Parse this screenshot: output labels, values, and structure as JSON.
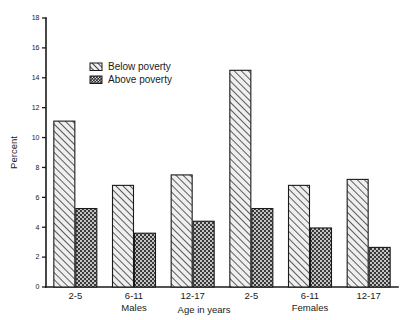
{
  "chart_data": {
    "type": "bar",
    "title": "",
    "subtitle": "",
    "xlabel": "Age in years",
    "ylabel": "Percent",
    "ylim": [
      0,
      18
    ],
    "ytick_step": 2,
    "yticks": [
      "0",
      "2",
      "4",
      "6",
      "8",
      "10",
      "12",
      "14",
      "16",
      "18"
    ],
    "grid": false,
    "legend_position": "upper-left-inside",
    "categories": [
      "2-5",
      "6-11",
      "12-17",
      "2-5",
      "6-11",
      "12-17"
    ],
    "group_labels": [
      "Males",
      "Females"
    ],
    "series": [
      {
        "name": "Below poverty",
        "pattern": "diagonal-hatch",
        "color": "#e8e8e8",
        "values": [
          11.1,
          6.8,
          7.5,
          14.5,
          6.8,
          7.2
        ]
      },
      {
        "name": "Above poverty",
        "pattern": "checkered-dots",
        "color": "#3a3a3a",
        "values": [
          5.25,
          3.6,
          4.4,
          5.25,
          3.95,
          2.65
        ]
      }
    ]
  },
  "legend": {
    "items": [
      {
        "label": "Below poverty"
      },
      {
        "label": "Above poverty"
      }
    ]
  },
  "axes": {
    "y_title": "Percent",
    "x_title": "Age in years"
  },
  "colors": {
    "axis": "#1a1a1a",
    "below_poverty_fill": "#e8e8e8",
    "above_poverty_fill": "#3a3a3a",
    "background": "#ffffff"
  }
}
